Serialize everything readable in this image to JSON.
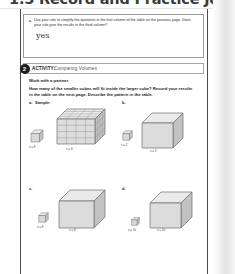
{
  "header": {
    "title": "1.5 Record and Practice Journal"
  },
  "question": {
    "marker": "c.",
    "text": "Use your rule to simplify the quotients in the first column of the table on the previous page. Does your rule give the results in the third column?",
    "handwritten_answer": "yes"
  },
  "activity": {
    "number": "2",
    "label": "ACTIVITY:",
    "title": "Comparing Volumes",
    "partner_note": "Work with a partner.",
    "prompt": "How many of the smaller cubes will fit inside the larger cube? Record your results in the table on the next page. Describe the pattern in the table."
  },
  "problems": [
    {
      "letter": "a.",
      "sample_note": "Sample:",
      "small_cube_label": "s = 8",
      "large_cube_label": "s = 4²",
      "large_cube_style": "gridded",
      "divisions": 4
    },
    {
      "letter": "b.",
      "sample_note": "",
      "small_cube_label": "s = 2",
      "large_cube_label": "s = 2²",
      "large_cube_style": "plain",
      "divisions": 0
    },
    {
      "letter": "c.",
      "sample_note": "",
      "small_cube_label": "s = 8",
      "large_cube_label": "s = 8²",
      "large_cube_style": "plain",
      "divisions": 0
    },
    {
      "letter": "d.",
      "sample_note": "",
      "small_cube_label": "s = 10",
      "large_cube_label": "s = 10²",
      "large_cube_style": "plain",
      "divisions": 0
    }
  ],
  "colors": {
    "page_border": "#4a4a4a",
    "badge": "#1c1c1c",
    "header_text": "#3a3a3a",
    "cube_face_front": "#d8d8d8",
    "cube_face_top": "#eaeaea",
    "cube_face_side": "#c2c2c2",
    "cube_stroke": "#6e6e6e"
  }
}
